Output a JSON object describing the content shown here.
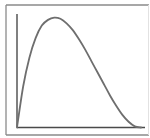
{
  "figure": {
    "colors": {
      "frame": "#8a8a8a",
      "frame_right": "#e2e2e2",
      "axes": "#4a4a4a",
      "curve": "#6e6e6e",
      "background": "#ffffff"
    }
  },
  "chart_data": {
    "type": "line",
    "title": "",
    "xlabel": "",
    "ylabel": "",
    "grid": false,
    "legend": "none",
    "xlim": [
      0,
      1
    ],
    "ylim": [
      0,
      1
    ],
    "series": [
      {
        "name": "density-curve",
        "shape": "right-skewed unimodal (beta-like, a=2, b=3)",
        "peak_x": 0.32,
        "peak_y": 0.95,
        "x": [
          0,
          0.05,
          0.1,
          0.15,
          0.2,
          0.25,
          0.3,
          0.35,
          0.4,
          0.45,
          0.5,
          0.55,
          0.6,
          0.65,
          0.7,
          0.75,
          0.8,
          0.85,
          0.9,
          0.95,
          1.0
        ],
        "y": [
          0,
          0.36,
          0.61,
          0.78,
          0.89,
          0.94,
          0.96,
          0.95,
          0.91,
          0.85,
          0.77,
          0.68,
          0.58,
          0.48,
          0.38,
          0.28,
          0.19,
          0.11,
          0.05,
          0.01,
          0
        ]
      }
    ]
  }
}
